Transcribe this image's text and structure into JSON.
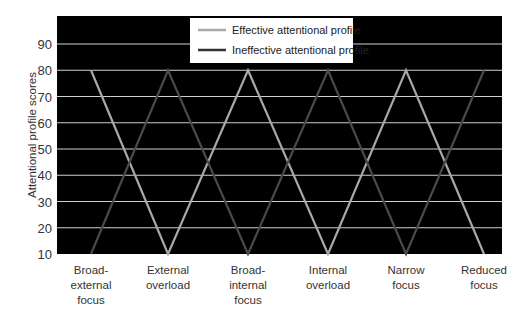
{
  "chart_data": {
    "type": "line",
    "title": "",
    "xlabel": "",
    "ylabel": "Attentional profile scores",
    "ylim": [
      10,
      100
    ],
    "yticks": [
      10,
      20,
      30,
      40,
      50,
      60,
      70,
      80,
      90
    ],
    "grid": true,
    "legend_position": "top-center-inside",
    "categories": [
      "Broad-external focus",
      "External overload",
      "Broad-internal focus",
      "Internal overload",
      "Narrow focus",
      "Reduced focus"
    ],
    "category_lines": [
      [
        "Broad-",
        "external",
        "focus"
      ],
      [
        "External",
        "overload"
      ],
      [
        "Broad-",
        "internal",
        "focus"
      ],
      [
        "Internal",
        "overload"
      ],
      [
        "Narrow",
        "focus"
      ],
      [
        "Reduced",
        "focus"
      ]
    ],
    "series": [
      {
        "name": "Effective attentional profile",
        "color": "#a8a8a8",
        "values": [
          80,
          10,
          80,
          10,
          80,
          10
        ]
      },
      {
        "name": "Ineffective attentional profile",
        "color": "#4a4a4a",
        "values": [
          10,
          80,
          10,
          80,
          10,
          80
        ]
      }
    ]
  },
  "colors": {
    "plot_background": "#000000",
    "gridline": "#cfcfcf",
    "legend_background": "#ffffff"
  }
}
